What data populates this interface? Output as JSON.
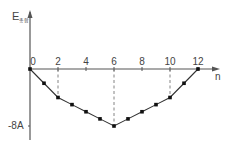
{
  "chart_data": {
    "type": "line",
    "title": "",
    "xlabel": "n",
    "ylabel": "E",
    "ylabel_subscript": "총합",
    "x": [
      0,
      1,
      2,
      3,
      4,
      5,
      6,
      7,
      8,
      9,
      10,
      11,
      12
    ],
    "values": [
      0,
      -2,
      -4,
      -5,
      -6,
      -7,
      -8,
      -7,
      -6,
      -5,
      -4,
      -2,
      0
    ],
    "value_unit": "A",
    "x_ticks": [
      "0",
      "2",
      "4",
      "6",
      "8",
      "10",
      "12"
    ],
    "y_ticks": [
      "-8A"
    ],
    "xlim": [
      0,
      12.5
    ],
    "ylim": [
      -8.5,
      6
    ],
    "dashed_guides_at": [
      2,
      6,
      10
    ],
    "grid": false,
    "legend": null
  },
  "colors": {
    "axis": "#555555",
    "line": "#333333",
    "marker": "#111111",
    "guide": "#777777"
  }
}
